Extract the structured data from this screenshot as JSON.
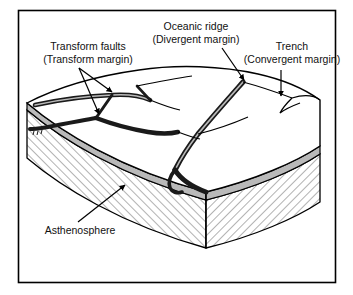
{
  "figure": {
    "border_color": "#000000",
    "ink_color": "#000000",
    "hatch_color": "#4a4a4a",
    "lithosphere_band_color": "#b9b9b9",
    "plate_surface_color": "#ffffff",
    "background_color": "#ffffff"
  },
  "labels": {
    "transform_faults": {
      "line1": "Transform faults",
      "line2": "(Transform margin)"
    },
    "oceanic_ridge": {
      "line1": "Oceanic ridge",
      "line2": "(Divergent margin)"
    },
    "trench": {
      "line1": "Trench",
      "line2": "(Convergent margin)"
    },
    "asthenosphere": {
      "line1": "Asthenosphere"
    }
  }
}
